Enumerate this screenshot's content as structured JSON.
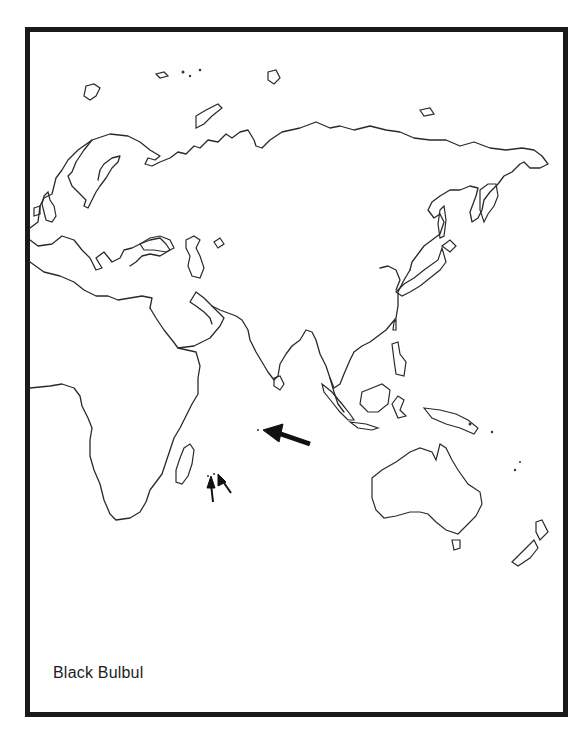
{
  "figure": {
    "type": "range-map",
    "title": "Black Bulbul",
    "region": "Eastern Hemisphere (Europe, Africa, Asia, Australasia)",
    "colors": {
      "frame": "#1a1a1a",
      "coastline": "#2a2a2a",
      "background": "#ffffff",
      "arrows": "#111111"
    }
  },
  "markers": [
    {
      "name": "large-arrow",
      "points_to": "small island in central Indian Ocean",
      "count": 1
    },
    {
      "name": "small-arrows",
      "points_to": "Mascarene-area islands east of Madagascar",
      "count": 2
    }
  ]
}
